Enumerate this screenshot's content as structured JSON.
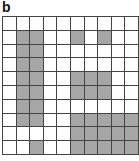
{
  "panel": {
    "label": "b"
  },
  "grid": {
    "rows": 10,
    "cols": 10,
    "shaded_color": "#a6a6a6",
    "empty_color": "#ffffff",
    "shaded_cells": [
      [],
      [
        1,
        2,
        5,
        7
      ],
      [
        1,
        2
      ],
      [
        1,
        2
      ],
      [
        1,
        2,
        5,
        6,
        7
      ],
      [
        1,
        2,
        5,
        6,
        7
      ],
      [
        1,
        2
      ],
      [
        1,
        2,
        5,
        6,
        7,
        8,
        9
      ],
      [
        5,
        6,
        7,
        8,
        9
      ],
      [
        2,
        5,
        6,
        7,
        8,
        9
      ]
    ]
  }
}
